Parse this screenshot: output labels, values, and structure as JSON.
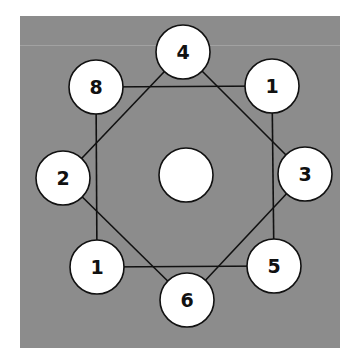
{
  "diagram": {
    "background_color": "#8c8c8c",
    "node_fill": "#ffffff",
    "stroke_color": "#111111",
    "node_radius": 27,
    "center_node": {
      "x": 186,
      "y": 175,
      "label": ""
    },
    "nodes": [
      {
        "id": "n4",
        "x": 183,
        "y": 52,
        "label": "4"
      },
      {
        "id": "n1a",
        "x": 272,
        "y": 86,
        "label": "1"
      },
      {
        "id": "n3",
        "x": 305,
        "y": 174,
        "label": "3"
      },
      {
        "id": "n5",
        "x": 274,
        "y": 266,
        "label": "5"
      },
      {
        "id": "n6",
        "x": 187,
        "y": 300,
        "label": "6"
      },
      {
        "id": "n1b",
        "x": 97,
        "y": 267,
        "label": "1"
      },
      {
        "id": "n2",
        "x": 63,
        "y": 178,
        "label": "2"
      },
      {
        "id": "n8",
        "x": 96,
        "y": 87,
        "label": "8"
      }
    ],
    "square_edges": [
      [
        "n8",
        "n1a"
      ],
      [
        "n1a",
        "n5"
      ],
      [
        "n5",
        "n1b"
      ],
      [
        "n1b",
        "n8"
      ]
    ],
    "diamond_edges": [
      [
        "n4",
        "n3"
      ],
      [
        "n3",
        "n6"
      ],
      [
        "n6",
        "n2"
      ],
      [
        "n2",
        "n4"
      ]
    ]
  }
}
